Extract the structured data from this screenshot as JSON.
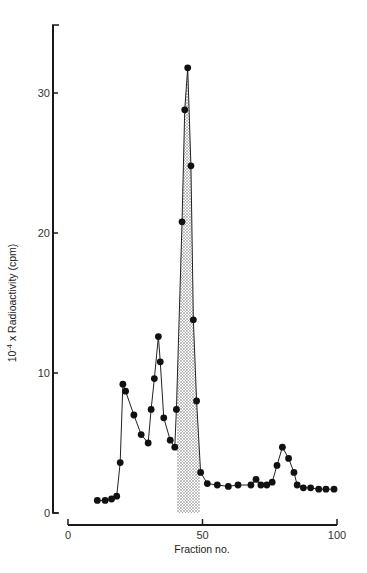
{
  "chart_data": {
    "type": "line",
    "title": "",
    "xlabel": "Fraction no.",
    "ylabel": "10^-4 x Radioactivity (cpm)",
    "ylabel_prefix": "10",
    "ylabel_exponent": "-4",
    "ylabel_suffix": " x Radioactivity (cpm)",
    "xlim": [
      0,
      100
    ],
    "ylim": [
      0,
      35
    ],
    "x_ticks": [
      0,
      50,
      100
    ],
    "x_tick_labels": [
      "0",
      "50",
      "100"
    ],
    "y_ticks": [
      0,
      10,
      20,
      30
    ],
    "y_tick_labels": [
      "0",
      "10",
      "20",
      "30"
    ],
    "grid": false,
    "legend": null,
    "shaded_region": {
      "x_start": 40.5,
      "x_end": 49,
      "pattern": "stippled",
      "description": "pooled peak fractions"
    },
    "series": [
      {
        "name": "Radioactivity",
        "marker": "filled-circle",
        "x": [
          10.9,
          13.8,
          16.2,
          18.1,
          19.4,
          20.4,
          21.4,
          24.5,
          27.2,
          29.8,
          30.9,
          32.1,
          33.6,
          34.3,
          35.6,
          38.0,
          39.7,
          40.3,
          42.4,
          43.4,
          44.5,
          45.7,
          46.6,
          47.8,
          49.3,
          51.8,
          55.5,
          59.6,
          63.2,
          68.0,
          69.9,
          71.7,
          73.9,
          75.9,
          77.7,
          79.7,
          82.0,
          84.0,
          85.2,
          87.5,
          90.2,
          93.2,
          95.9,
          98.9
        ],
        "values": [
          0.9,
          0.9,
          1.0,
          1.2,
          3.6,
          9.2,
          8.7,
          7.0,
          5.6,
          5.0,
          7.4,
          9.6,
          12.6,
          10.8,
          6.8,
          5.2,
          4.7,
          7.4,
          20.8,
          28.8,
          31.8,
          24.8,
          13.8,
          8.0,
          2.9,
          2.1,
          2.0,
          1.9,
          2.0,
          2.0,
          2.4,
          2.0,
          2.0,
          2.2,
          3.4,
          4.7,
          3.9,
          2.9,
          2.0,
          1.8,
          1.8,
          1.7,
          1.7,
          1.7
        ]
      }
    ]
  },
  "layout": {
    "plot_left": 53,
    "y_zero_px": 513,
    "y_px_per_unit": 14,
    "y_axis_top_px": 25,
    "x_axis_y_px": 525,
    "x_zero_px": 68,
    "x_px_per_unit": 2.69
  }
}
